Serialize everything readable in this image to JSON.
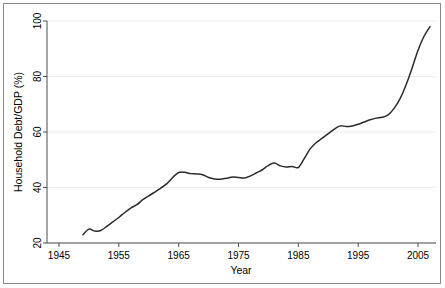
{
  "figure": {
    "background_color": "#ffffff",
    "frame_color": "#8a8a8a",
    "line_color": "#2b2b2b",
    "grid_color": "#ececec",
    "axis_color": "#4d4d4d"
  },
  "axes": {
    "x_title": "Year",
    "y_title": "Household Debt/GDP (%)",
    "x_ticks": [
      "1945",
      "1955",
      "1965",
      "1975",
      "1985",
      "1995",
      "2005"
    ],
    "y_ticks": [
      "20",
      "40",
      "60",
      "80",
      "100"
    ]
  },
  "chart_data": {
    "type": "line",
    "title": "",
    "xlabel": "Year",
    "ylabel": "Household Debt/GDP (%)",
    "xlim": [
      1943,
      2008
    ],
    "ylim": [
      20,
      100
    ],
    "xticks": [
      1945,
      1955,
      1965,
      1975,
      1985,
      1995,
      2005
    ],
    "yticks": [
      20,
      40,
      60,
      80,
      100
    ],
    "grid": "horizontal",
    "legend": "none",
    "series": [
      {
        "name": "Household Debt/GDP",
        "x": [
          1949,
          1950,
          1951,
          1952,
          1953,
          1954,
          1955,
          1956,
          1957,
          1958,
          1959,
          1960,
          1961,
          1962,
          1963,
          1964,
          1965,
          1966,
          1967,
          1968,
          1969,
          1970,
          1971,
          1972,
          1973,
          1974,
          1975,
          1976,
          1977,
          1978,
          1979,
          1980,
          1981,
          1982,
          1983,
          1984,
          1985,
          1986,
          1987,
          1988,
          1989,
          1990,
          1991,
          1992,
          1993,
          1994,
          1995,
          1996,
          1997,
          1998,
          1999,
          2000,
          2001,
          2002,
          2003,
          2004,
          2005,
          2006,
          2007
        ],
        "values": [
          23.0,
          25.0,
          24.3,
          24.5,
          26.0,
          27.6,
          29.2,
          31.0,
          32.6,
          33.8,
          35.6,
          37.0,
          38.3,
          39.8,
          41.3,
          43.6,
          45.4,
          45.5,
          45.0,
          44.9,
          44.6,
          43.6,
          43.1,
          43.0,
          43.3,
          43.8,
          43.6,
          43.4,
          44.2,
          45.3,
          46.4,
          48.0,
          48.8,
          47.8,
          47.4,
          47.6,
          47.2,
          50.5,
          54.0,
          56.2,
          57.8,
          59.4,
          61.0,
          62.2,
          62.0,
          62.2,
          62.8,
          63.6,
          64.4,
          65.0,
          65.3,
          66.2,
          68.5,
          72.0,
          77.0,
          83.0,
          89.5,
          94.5,
          98.0
        ]
      }
    ]
  }
}
